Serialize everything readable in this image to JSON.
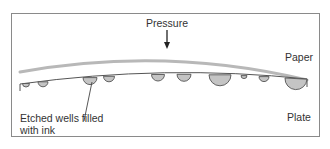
{
  "diagram": {
    "type": "gravure-printing-cross-section",
    "labels": {
      "pressure": "Pressure",
      "paper": "Paper",
      "plate": "Plate",
      "wells": "Etched wells filled with ink"
    },
    "colors": {
      "frame": "#8a8a8a",
      "paper": "#b8b8b8",
      "plate_line": "#555555",
      "ink_fill": "#c4c4c4",
      "ink_stroke": "#555555",
      "text": "#333333",
      "arrow": "#222222"
    },
    "wells": [
      {
        "cx": 26,
        "r": 3.5
      },
      {
        "cx": 43,
        "r": 5
      },
      {
        "cx": 90,
        "r": 7
      },
      {
        "cx": 109,
        "r": 5.5
      },
      {
        "cx": 158,
        "r": 6.5
      },
      {
        "cx": 184,
        "r": 7
      },
      {
        "cx": 220,
        "r": 11
      },
      {
        "cx": 244,
        "r": 3
      },
      {
        "cx": 264,
        "r": 5
      },
      {
        "cx": 296,
        "r": 11
      }
    ]
  }
}
